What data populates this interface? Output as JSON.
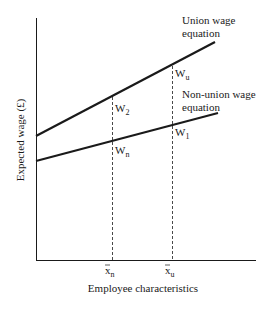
{
  "diagram": {
    "type": "wage-equation-diagram",
    "axes": {
      "y_label": "Expected wage (£)",
      "x_label": "Employee characteristics",
      "x_ticks": [
        {
          "symbol": "x",
          "subscript": "n",
          "label": "x̄n"
        },
        {
          "symbol": "x",
          "subscript": "u",
          "label": "x̄u"
        }
      ]
    },
    "lines": [
      {
        "name": "Union wage equation",
        "label_line1": "Union wage",
        "label_line2": "equation"
      },
      {
        "name": "Non-union wage equation",
        "label_line1": "Non-union wage",
        "label_line2": "equation"
      }
    ],
    "points": {
      "W2": {
        "letter": "W",
        "subscript": "2"
      },
      "Wn": {
        "letter": "W",
        "subscript": "n"
      },
      "Wu": {
        "letter": "W",
        "subscript": "u"
      },
      "W1": {
        "letter": "W",
        "subscript": "1"
      }
    },
    "colors": {
      "ink": "#1a1a1a",
      "background": "#ffffff"
    }
  }
}
